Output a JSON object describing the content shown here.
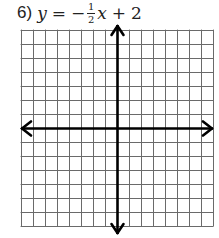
{
  "problem": {
    "number": "6)",
    "lhs_var": "y",
    "equals": "=",
    "sign": "−",
    "frac_num": "1",
    "frac_den": "2",
    "rhs_var": "x",
    "plus": "+",
    "constant": "2",
    "equation_text": "y = -1/2 x + 2"
  },
  "graph": {
    "columns": 16,
    "rows": 14,
    "cell_width_px": 12,
    "cell_height_px": 14,
    "grid_color": "#555555",
    "axis_color": "#000000",
    "x_axis": "horizontal arrow both ends",
    "y_axis": "vertical arrow both ends"
  }
}
